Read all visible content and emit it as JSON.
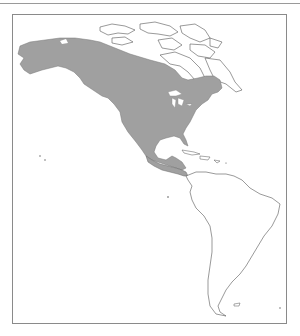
{
  "map": {
    "type": "range map",
    "region": "Americas",
    "range_color": "#a0a0a0",
    "outline_color": "#555555",
    "background": "#ffffff",
    "shaded_area": "North America (Alaska, Canada south of Arctic, USA, Mexico, Central America)"
  }
}
